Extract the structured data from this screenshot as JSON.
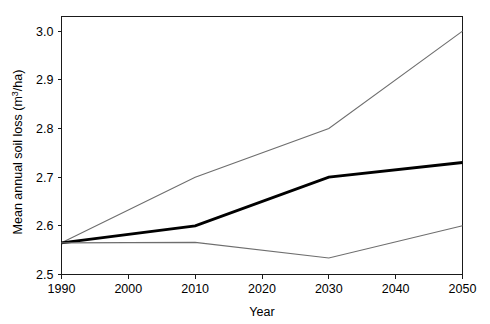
{
  "chart_data": {
    "type": "line",
    "title": "",
    "xlabel": "Year",
    "ylabel_prefix": "Mean annual soil loss (m",
    "ylabel_sup": "3",
    "ylabel_suffix": "/ha)",
    "ylabel": "Mean annual soil loss (m3/ha)",
    "x": [
      1990,
      2010,
      2030,
      2050
    ],
    "xlim": [
      1990,
      2050
    ],
    "ylim": [
      2.5,
      3.03
    ],
    "grid": false,
    "legend": "none",
    "xticks": [
      "1990",
      "2000",
      "2010",
      "2020",
      "2030",
      "2040",
      "2050"
    ],
    "xtick_values": [
      1990,
      2000,
      2010,
      2020,
      2030,
      2040,
      2050
    ],
    "yticks": [
      "2.5",
      "2.6",
      "2.7",
      "2.8",
      "2.9",
      "3.0"
    ],
    "ytick_values": [
      2.5,
      2.6,
      2.7,
      2.8,
      2.9,
      3.0
    ],
    "series": [
      {
        "name": "upper-bound",
        "color": "#6e6e6e",
        "width": "thin",
        "values": [
          2.565,
          2.7,
          2.8,
          3.0
        ]
      },
      {
        "name": "mean",
        "color": "#000000",
        "width": "thick",
        "values": [
          2.565,
          2.6,
          2.7,
          2.73
        ]
      },
      {
        "name": "lower-bound",
        "color": "#6e6e6e",
        "width": "thin",
        "values": [
          2.565,
          2.566,
          2.534,
          2.6
        ]
      }
    ]
  }
}
